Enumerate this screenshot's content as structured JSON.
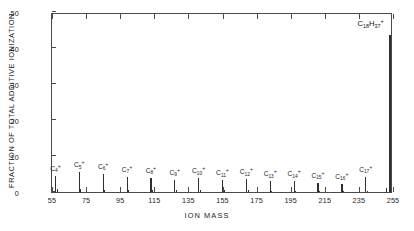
{
  "chart_data": {
    "type": "bar",
    "title": "",
    "xlabel": "ION MASS",
    "ylabel": "FRACTION OF TOTAL ADDITIVE IONIZATION",
    "xlim": [
      55,
      255
    ],
    "ylim": [
      0,
      0.5
    ],
    "grid": false,
    "legend": null,
    "xticks": [
      55,
      75,
      95,
      115,
      135,
      155,
      175,
      195,
      215,
      235,
      255
    ],
    "xtick_labels": [
      "55",
      "75",
      "95",
      "115",
      "135",
      "155",
      "175",
      "195",
      "215",
      "235",
      "255"
    ],
    "yticks": [
      0,
      0.1,
      0.2,
      0.3,
      0.4,
      0.5
    ],
    "ytick_labels": [
      "0",
      ".10",
      ".20",
      ".30",
      ".40",
      ".50"
    ],
    "annotations": [
      {
        "text": "C18H37+",
        "html": "C<sub>18</sub>H<sub>37</sub><sup>+</sup>",
        "x": 253,
        "y": 0.455
      }
    ],
    "series_note": "Mass spectrum of additive: alkyl fragment ion series C4+ through C17+ with dominant C18H37+ parent fragment at m/z 253.",
    "labeled_peaks": [
      {
        "label": "C4+",
        "html": "C<sub>4</sub><sup>+</sup>",
        "x": 57,
        "value": 0.045
      },
      {
        "label": "C5+",
        "html": "C<sub>5</sub><sup>+</sup>",
        "x": 71,
        "value": 0.055
      },
      {
        "label": "C6+",
        "html": "C<sub>6</sub><sup>+</sup>",
        "x": 85,
        "value": 0.05
      },
      {
        "label": "C7+",
        "html": "C<sub>7</sub><sup>+</sup>",
        "x": 99,
        "value": 0.043
      },
      {
        "label": "C8+",
        "html": "C<sub>8</sub><sup>+</sup>",
        "x": 113,
        "value": 0.04
      },
      {
        "label": "C9+",
        "html": "C<sub>9</sub><sup>+</sup>",
        "x": 127,
        "value": 0.034
      },
      {
        "label": "C10+",
        "html": "C<sub>10</sub><sup>+</sup>",
        "x": 141,
        "value": 0.038
      },
      {
        "label": "C11+",
        "html": "C<sub>11</sub><sup>+</sup>",
        "x": 155,
        "value": 0.032
      },
      {
        "label": "C12+",
        "html": "C<sub>12</sub><sup>+</sup>",
        "x": 169,
        "value": 0.035
      },
      {
        "label": "C13+",
        "html": "C<sub>13</sub><sup>+</sup>",
        "x": 183,
        "value": 0.03
      },
      {
        "label": "C14+",
        "html": "C<sub>14</sub><sup>+</sup>",
        "x": 197,
        "value": 0.03
      },
      {
        "label": "C15+",
        "html": "C<sub>15</sub><sup>+</sup>",
        "x": 211,
        "value": 0.025
      },
      {
        "label": "C16+",
        "html": "C<sub>16</sub><sup>+</sup>",
        "x": 225,
        "value": 0.022
      },
      {
        "label": "C17+",
        "html": "C<sub>17</sub><sup>+</sup>",
        "x": 239,
        "value": 0.042
      },
      {
        "label": "C18H37+",
        "html": "C<sub>18</sub>H<sub>37</sub><sup>+</sup>",
        "x": 253,
        "value": 0.435
      }
    ],
    "minor_peaks": [
      {
        "x": 58,
        "value": 0.009
      },
      {
        "x": 72,
        "value": 0.007
      },
      {
        "x": 86,
        "value": 0.006
      },
      {
        "x": 100,
        "value": 0.006
      },
      {
        "x": 114,
        "value": 0.006
      },
      {
        "x": 128,
        "value": 0.005
      },
      {
        "x": 142,
        "value": 0.005
      },
      {
        "x": 156,
        "value": 0.005
      },
      {
        "x": 170,
        "value": 0.005
      },
      {
        "x": 184,
        "value": 0.004
      },
      {
        "x": 198,
        "value": 0.004
      },
      {
        "x": 212,
        "value": 0.004
      },
      {
        "x": 226,
        "value": 0.004
      },
      {
        "x": 240,
        "value": 0.004
      },
      {
        "x": 251,
        "value": 0.012
      }
    ]
  }
}
